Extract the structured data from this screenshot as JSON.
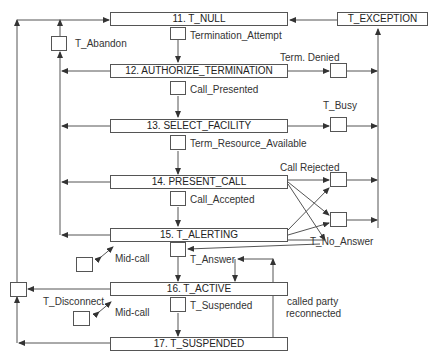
{
  "diagram": {
    "states": [
      {
        "id": "11",
        "label": "11. T_NULL"
      },
      {
        "id": "12",
        "label": "12. AUTHORIZE_TERMINATION"
      },
      {
        "id": "13",
        "label": "13. SELECT_FACILITY"
      },
      {
        "id": "14",
        "label": "14. PRESENT_CALL"
      },
      {
        "id": "15",
        "label": "15. T_ALERTING"
      },
      {
        "id": "16",
        "label": "16. T_ACTIVE"
      },
      {
        "id": "17",
        "label": "17. T_SUSPENDED"
      }
    ],
    "exception_state": {
      "label": "T_EXCEPTION"
    },
    "detection_points": {
      "termination_attempt": "Termination_Attempt",
      "call_presented": "Call_Presented",
      "term_resource_available": "Term_Resource_Available",
      "call_accepted": "Call_Accepted",
      "t_answer": "T_Answer",
      "t_suspended": "T_Suspended",
      "t_abandon": "T_Abandon",
      "t_disconnect": "T_Disconnect",
      "term_denied": "Term. Denied",
      "t_busy": "T_Busy",
      "call_rejected": "Call Rejected",
      "t_no_answer": "T_No_Answer",
      "mid_call_1": "Mid-call",
      "mid_call_2": "Mid-call",
      "called_party_reconnected_line1": "called party",
      "called_party_reconnected_line2": "reconnected"
    },
    "colors": {
      "line": "#555555",
      "box_border": "#555555",
      "text": "#333333",
      "background": "#ffffff"
    }
  }
}
